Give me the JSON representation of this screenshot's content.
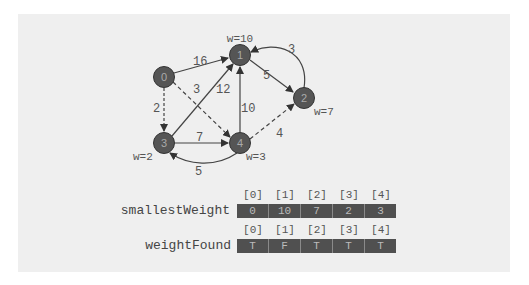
{
  "graph": {
    "nodes": [
      {
        "id": "0",
        "label": "0",
        "weight_label": ""
      },
      {
        "id": "1",
        "label": "1",
        "weight_label": "w=10"
      },
      {
        "id": "2",
        "label": "2",
        "weight_label": "w=7"
      },
      {
        "id": "3",
        "label": "3",
        "weight_label": "w=2"
      },
      {
        "id": "4",
        "label": "4",
        "weight_label": "w=3"
      }
    ],
    "edges": [
      {
        "from": "0",
        "to": "1",
        "weight": "16",
        "style": "solid"
      },
      {
        "from": "0",
        "to": "4",
        "weight": "3",
        "style": "dashed"
      },
      {
        "from": "0",
        "to": "3",
        "weight": "2",
        "style": "dashed"
      },
      {
        "from": "3",
        "to": "1",
        "weight": "12",
        "style": "solid"
      },
      {
        "from": "4",
        "to": "1",
        "weight": "10",
        "style": "solid"
      },
      {
        "from": "1",
        "to": "2",
        "weight": "5",
        "style": "solid"
      },
      {
        "from": "2",
        "to": "1",
        "weight": "3",
        "style": "solid"
      },
      {
        "from": "3",
        "to": "4",
        "weight": "7",
        "style": "solid"
      },
      {
        "from": "4",
        "to": "3",
        "weight": "5",
        "style": "solid"
      },
      {
        "from": "4",
        "to": "2",
        "weight": "4",
        "style": "dashed"
      }
    ]
  },
  "arrays": {
    "smallestWeight": {
      "label": "smallestWeight",
      "indices": [
        "[0]",
        "[1]",
        "[2]",
        "[3]",
        "[4]"
      ],
      "values": [
        "0",
        "10",
        "7",
        "2",
        "3"
      ]
    },
    "weightFound": {
      "label": "weightFound",
      "indices": [
        "[0]",
        "[1]",
        "[2]",
        "[3]",
        "[4]"
      ],
      "values": [
        "T",
        "F",
        "T",
        "T",
        "T"
      ]
    }
  },
  "colors": {
    "panel": "#efefef",
    "node": "#555555",
    "edge": "#444444",
    "cell": "#505050"
  }
}
